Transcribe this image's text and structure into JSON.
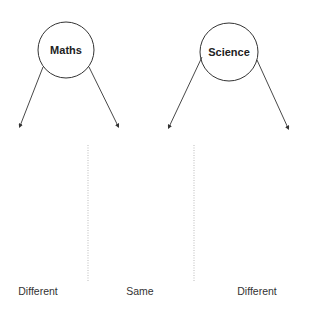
{
  "diagram": {
    "nodes": [
      {
        "id": "maths",
        "label": "Maths"
      },
      {
        "id": "science",
        "label": "Science"
      }
    ],
    "categories": [
      {
        "label": "Different"
      },
      {
        "label": "Same"
      },
      {
        "label": "Different"
      }
    ],
    "colors": {
      "stroke": "#333333",
      "divider": "#aaaaaa",
      "text": "#222222"
    }
  }
}
